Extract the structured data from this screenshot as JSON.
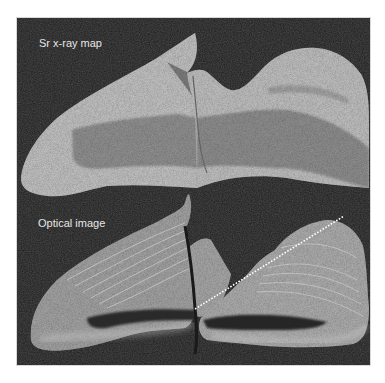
{
  "figure": {
    "panels": [
      {
        "id": "sr-xray",
        "label": "Sr x-ray map"
      },
      {
        "id": "optical",
        "label": "Optical image"
      }
    ],
    "colors": {
      "background": "#1c1c1c",
      "specimen_light": "#bdbdbd",
      "specimen_inner": "#8a8a8a",
      "transect_line": "#ffffff"
    },
    "annotation": {
      "type": "dotted-transect-line",
      "from": [
        194,
        308
      ],
      "to": [
        343,
        215
      ]
    }
  }
}
